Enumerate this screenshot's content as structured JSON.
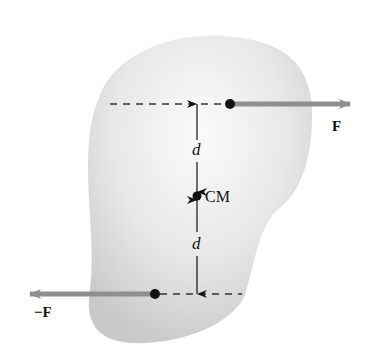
{
  "diagram": {
    "type": "physics-force-couple",
    "body": {
      "shape": "irregular-rigid-body",
      "fill": "#e4e4e4"
    },
    "labels": {
      "force_top": "F",
      "force_bottom": "−F",
      "distance_top": "d",
      "distance_bottom": "d",
      "center_of_mass": "CM"
    },
    "colors": {
      "arrow": "#8f8f8f",
      "dashed_line": "#333333",
      "dot": "#111111",
      "background": "#ffffff"
    }
  }
}
